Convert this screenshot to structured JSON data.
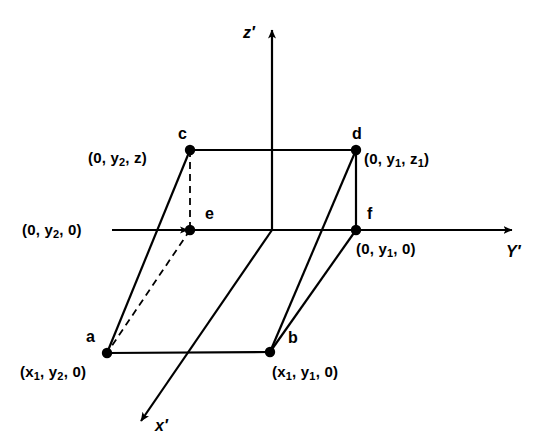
{
  "figure": {
    "background_color": "#ffffff",
    "stroke_color": "#000000"
  },
  "axes": [
    {
      "id": "z",
      "label": "z′",
      "label_x": 243,
      "label_y": 25,
      "direction": "up"
    },
    {
      "id": "y",
      "label": "Y′",
      "label_x": 506,
      "label_y": 244,
      "direction": "right"
    },
    {
      "id": "x",
      "label": "x′",
      "label_x": 155,
      "label_y": 418,
      "direction": "down-left"
    }
  ],
  "origin": {
    "x": 272,
    "y": 230
  },
  "vertices": [
    {
      "id": "c",
      "name": "c",
      "x": 190,
      "y": 150,
      "name_x": 178,
      "name_y": 126,
      "coord_html": "(0, y<sub>2</sub>, z)",
      "coord_x": 88,
      "coord_y": 150
    },
    {
      "id": "d",
      "name": "d",
      "x": 356,
      "y": 150,
      "name_x": 352,
      "name_y": 126,
      "coord_html": "(0, y<sub>1</sub>, z<sub>1</sub>)",
      "coord_x": 364,
      "coord_y": 151
    },
    {
      "id": "e",
      "name": "e",
      "x": 190,
      "y": 230,
      "name_x": 205,
      "name_y": 206,
      "coord_html": "(0, y<sub>2</sub>, 0)",
      "coord_x": 22,
      "coord_y": 222
    },
    {
      "id": "f",
      "name": "f",
      "x": 356,
      "y": 230,
      "name_x": 367,
      "name_y": 206,
      "coord_html": "(0, y<sub>1</sub>, 0)",
      "coord_x": 356,
      "coord_y": 241
    },
    {
      "id": "a",
      "name": "a",
      "x": 107,
      "y": 353,
      "name_x": 86,
      "name_y": 329,
      "coord_html": "(x<sub>1</sub>, y<sub>2</sub>, 0)",
      "coord_x": 20,
      "coord_y": 364
    },
    {
      "id": "b",
      "name": "b",
      "x": 270,
      "y": 352,
      "name_x": 288,
      "name_y": 330,
      "coord_html": "(x<sub>1</sub>, y<sub>1</sub>, 0)",
      "coord_x": 272,
      "coord_y": 364
    }
  ],
  "edges": [
    {
      "from": "c",
      "to": "d",
      "style": "solid",
      "name": "edge-c-d"
    },
    {
      "from": "a",
      "to": "b",
      "style": "solid",
      "name": "edge-a-b"
    },
    {
      "from": "d",
      "to": "f",
      "style": "solid",
      "name": "edge-d-f"
    },
    {
      "from": "a",
      "to": "c",
      "style": "solid",
      "name": "edge-a-c"
    },
    {
      "from": "b",
      "to": "d",
      "style": "solid",
      "name": "edge-b-d"
    },
    {
      "from": "b",
      "to": "f",
      "style": "solid",
      "name": "edge-b-f"
    },
    {
      "from": "c",
      "to": "e",
      "style": "dashed",
      "name": "edge-c-e"
    },
    {
      "from": "e",
      "to": "a",
      "style": "dashed",
      "name": "edge-e-a"
    }
  ]
}
